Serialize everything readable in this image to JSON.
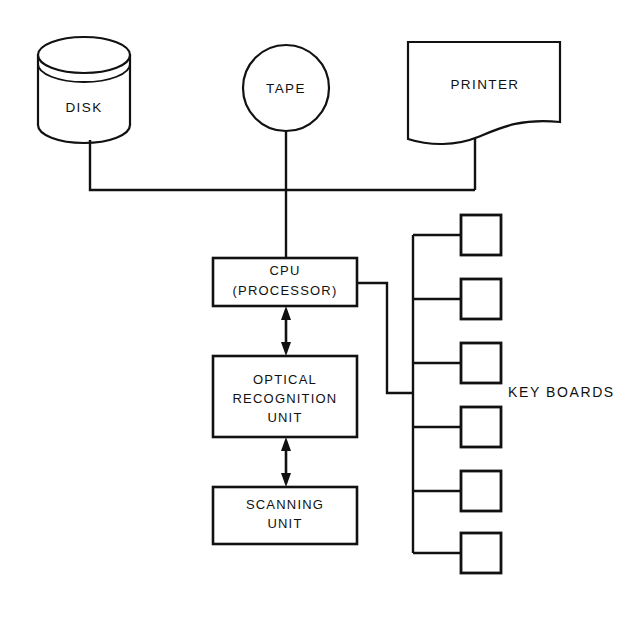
{
  "diagram": {
    "background_color": "#ffffff",
    "line_color": "#111111",
    "nodes": {
      "disk": {
        "label": "DISK",
        "shape": "cylinder"
      },
      "tape": {
        "label": "TAPE",
        "shape": "circle"
      },
      "printer": {
        "label": "PRINTER",
        "shape": "torn-paper"
      },
      "cpu": {
        "label_line1": "CPU",
        "label_line2": "(PROCESSOR)",
        "shape": "rectangle"
      },
      "optical_recognition_unit": {
        "label_line1": "OPTICAL",
        "label_line2": "RECOGNITION",
        "label_line3": "UNIT",
        "shape": "rectangle"
      },
      "scanning_unit": {
        "label_line1": "SCANNING",
        "label_line2": "UNIT",
        "shape": "rectangle"
      },
      "keyboards": {
        "label": "KEY BOARDS",
        "count": 6,
        "shape": "square"
      }
    },
    "connections": [
      {
        "from": "disk",
        "to": "peripheral-bus",
        "style": "plain"
      },
      {
        "from": "tape",
        "to": "peripheral-bus",
        "style": "plain"
      },
      {
        "from": "printer",
        "to": "peripheral-bus",
        "style": "plain"
      },
      {
        "from": "peripheral-bus",
        "to": "cpu",
        "style": "plain"
      },
      {
        "from": "cpu",
        "to": "optical_recognition_unit",
        "style": "double-arrow"
      },
      {
        "from": "optical_recognition_unit",
        "to": "scanning_unit",
        "style": "double-arrow"
      },
      {
        "from": "cpu",
        "to": "keyboard-bus",
        "style": "plain"
      }
    ]
  }
}
